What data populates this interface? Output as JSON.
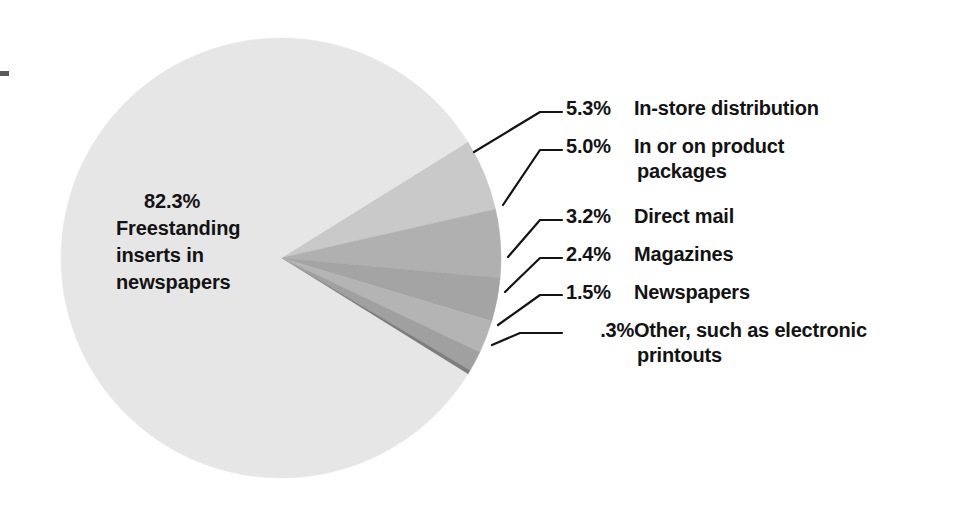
{
  "figure": {
    "title": "",
    "background_color": "#ffffff",
    "text_color": "#131313"
  },
  "pie": {
    "center_label": {
      "percent": "82.3%",
      "lines": [
        "Freestanding",
        "inserts in",
        "newspapers"
      ]
    },
    "geometry": {
      "cx": 281,
      "cy": 258,
      "r": 220
    }
  },
  "callouts": [
    {
      "percent": "5.3%",
      "label": "In-store distribution",
      "label_cont": ""
    },
    {
      "percent": "5.0%",
      "label": "In or on product",
      "label_cont": "packages"
    },
    {
      "percent": "3.2%",
      "label": "Direct mail",
      "label_cont": ""
    },
    {
      "percent": "2.4%",
      "label": "Magazines",
      "label_cont": ""
    },
    {
      "percent": "1.5%",
      "label": "Newspapers",
      "label_cont": ""
    },
    {
      "percent": ".3%",
      "label": "Other, such as electronic",
      "label_cont": "printouts"
    }
  ],
  "chart_data": {
    "type": "pie",
    "title": "",
    "subtitle": "",
    "xlabel": "",
    "ylabel": "",
    "legend_position": "callout-labels-right",
    "grid": false,
    "unit": "percent",
    "total": 100.0,
    "categories": [
      "Freestanding inserts in newspapers",
      "In-store distribution",
      "In or on product packages",
      "Direct mail",
      "Magazines",
      "Newspapers",
      "Other, such as electronic printouts"
    ],
    "values": [
      82.3,
      5.3,
      5.0,
      3.2,
      2.4,
      1.5,
      0.3
    ],
    "value_labels": [
      "82.3%",
      "5.3%",
      "5.0%",
      "3.2%",
      "2.4%",
      "1.5%",
      ".3%"
    ],
    "colors": [
      "#e6e6e6",
      "#c9c9c9",
      "#b0b0b0",
      "#a4a4a4",
      "#b4b4b4",
      "#a0a0a0",
      "#7d7d7d"
    ]
  }
}
